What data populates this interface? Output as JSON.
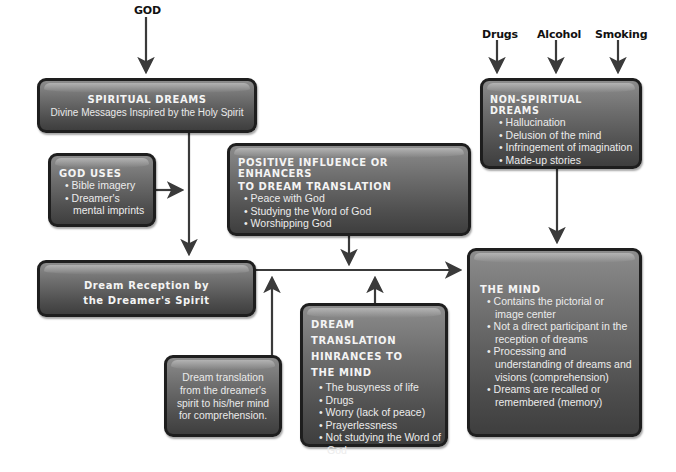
{
  "sources": {
    "god": "GOD",
    "drugs": "Drugs",
    "alcohol": "Alcohol",
    "smoking": "Smoking"
  },
  "spiritual_dreams": {
    "title": "SPIRITUAL DREAMS",
    "subtitle": "Divine Messages Inspired by the Holy Spirit"
  },
  "god_uses": {
    "title": "GOD USES",
    "items": [
      "Bible imagery",
      "Dreamer's mental imprints"
    ]
  },
  "positive_influence": {
    "title_line1": "POSITIVE INFLUENCE OR ENHANCERS",
    "title_line2": "TO DREAM TRANSLATION",
    "items": [
      "Peace with God",
      "Studying the Word of God",
      "Worshipping God"
    ]
  },
  "non_spiritual_dreams": {
    "title": "NON-SPIRITUAL DREAMS",
    "items": [
      "Hallucination",
      "Delusion of the mind",
      "Infringement of imagination",
      "Made-up stories"
    ]
  },
  "dream_reception": {
    "line1": "Dream Reception by",
    "line2": "the Dreamer's Spirit"
  },
  "dream_translation": {
    "text": "Dream translation from the dreamer's spirit to his/her mind for comprehension."
  },
  "hindrances": {
    "title_line1": "DREAM TRANSLATION",
    "title_line2": "HINRANCES TO",
    "title_line3": "THE MIND",
    "items": [
      "The busyness of life",
      "Drugs",
      "Worry (lack of peace)",
      "Prayerlessness",
      "Not studying the Word of God"
    ]
  },
  "the_mind": {
    "title": "THE MIND",
    "items": [
      "Contains the pictorial or image center",
      "Not a direct participant in the reception of dreams",
      "Processing and understanding of dreams and visions (comprehension)",
      "Dreams are recalled or remembered (memory)"
    ]
  },
  "colors": {
    "box_fill": "#5a5a5a",
    "box_border": "#1e1e1e",
    "arrow": "#3a3a3a",
    "text_light": "#f2f2f2"
  }
}
